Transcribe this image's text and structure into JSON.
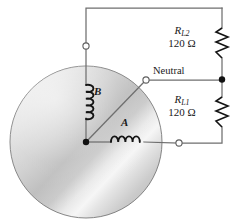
{
  "figure": {
    "type": "circuit-schematic",
    "background_color": "#ffffff",
    "wire_color": "#6b6b6b",
    "ink_color": "#1a1a1a"
  },
  "rotor": {
    "name": "alternator-rotor",
    "shape": "circle",
    "center": {
      "x": 86,
      "y": 142
    },
    "radius": 76,
    "fill_light": "#f2f2f2",
    "fill_dark": "#a8a8a8",
    "outline_color": "#707070"
  },
  "coils": [
    {
      "id": "coil-b",
      "label": "B",
      "orientation": "vertical",
      "turns": 5,
      "x": 86,
      "y_top": 84,
      "y_bottom": 118,
      "label_x": 94,
      "label_y": 86
    },
    {
      "id": "coil-a",
      "label": "A",
      "orientation": "horizontal",
      "turns": 4,
      "y": 142,
      "x_left": 110,
      "x_right": 144,
      "label_x": 121,
      "label_y": 117
    }
  ],
  "resistors": [
    {
      "id": "resistor-rl2",
      "name": "R",
      "subscript": "L2",
      "value": "120 Ω",
      "orientation": "vertical",
      "x": 222,
      "y_top": 28,
      "y_bottom": 58,
      "zigzags": 6
    },
    {
      "id": "resistor-rl1",
      "name": "R",
      "subscript": "L1",
      "value": "120 Ω",
      "orientation": "vertical",
      "x": 222,
      "y_top": 97,
      "y_bottom": 127,
      "zigzags": 6
    }
  ],
  "terminals": [
    {
      "id": "terminal-line-1",
      "style": "open-circle",
      "x": 86,
      "y": 46,
      "label": ""
    },
    {
      "id": "terminal-neutral",
      "style": "open-circle",
      "x": 146,
      "y": 80,
      "label": "Neutral"
    },
    {
      "id": "terminal-line-2",
      "style": "open-circle",
      "x": 179,
      "y": 143,
      "label": ""
    }
  ],
  "junctions": [
    {
      "id": "junction-rotor-center",
      "style": "filled-dot",
      "x": 86,
      "y": 142
    },
    {
      "id": "junction-neutral-tap",
      "style": "filled-dot",
      "x": 222,
      "y": 79
    }
  ],
  "labels": {
    "neutral": "Neutral",
    "coil_a": "A",
    "coil_b": "B",
    "rl2_name": "R",
    "rl2_sub": "L2",
    "rl2_value": "120 Ω",
    "rl1_name": "R",
    "rl1_sub": "L1",
    "rl1_value": "120 Ω"
  }
}
